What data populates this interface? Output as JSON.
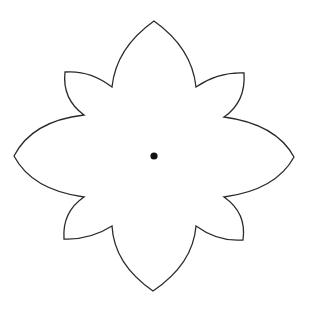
{
  "figure": {
    "title": "Eight-petal flower outline with center point",
    "background": "#ffffff",
    "stroke_color": "#2b2b2b",
    "dot_color": "#111111",
    "center": {
      "x": 154,
      "y": 156,
      "r": 3.6
    },
    "petals": {
      "large": [
        {
          "name": "top",
          "tip": [
            154,
            21
          ]
        },
        {
          "name": "right",
          "tip": [
            294,
            157
          ]
        },
        {
          "name": "bottom",
          "tip": [
            153,
            291
          ]
        },
        {
          "name": "left",
          "tip": [
            14,
            156
          ]
        }
      ],
      "small": [
        {
          "name": "top-left",
          "corner": [
            65,
            72
          ]
        },
        {
          "name": "top-right",
          "corner": [
            244,
            73
          ]
        },
        {
          "name": "bottom-right",
          "corner": [
            243,
            240
          ]
        },
        {
          "name": "bottom-left",
          "corner": [
            64,
            239
          ]
        }
      ]
    },
    "notches": [
      [
        112,
        87
      ],
      [
        196,
        87
      ],
      [
        224,
        117
      ],
      [
        224,
        197
      ],
      [
        196,
        226
      ],
      [
        112,
        226
      ],
      [
        84,
        197
      ],
      [
        84,
        115
      ]
    ]
  }
}
